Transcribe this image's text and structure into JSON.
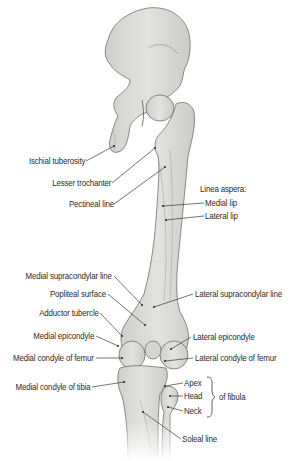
{
  "figure": {
    "colors": {
      "bone_fill": "#dcdcd9",
      "bone_shade": "#c9c9c5",
      "bone_outline": "#6f6f6b",
      "leader_line": "#3a3a3a",
      "label_text": "#2b2b2b",
      "background": "#ffffff"
    }
  },
  "labels": {
    "ischial_tuberosity": "Ischial tuberosity",
    "lesser_trochanter": "Lesser trochanter",
    "pectineal_line": "Pectineal line",
    "linea_aspera": "Linea aspera:",
    "medial_lip": "Medial lip",
    "lateral_lip": "Lateral lip",
    "medial_supracondylar_line": "Medial supracondylar line",
    "popliteal_surface": "Popliteal surface",
    "adductor_tubercle": "Adductor tubercle",
    "medial_epicondyle": "Medial epicondyle",
    "medial_condyle_femur": "Medial condyle of femur",
    "medial_condyle_tibia": "Medial condyle of tibia",
    "lateral_supracondylar_line": "Lateral supracondylar line",
    "lateral_epicondyle": "Lateral epicondyle",
    "lateral_condyle_femur": "Lateral condyle of femur",
    "apex": "Apex",
    "head": "Head",
    "neck": "Neck",
    "of_fibula": "of fibula",
    "soleal_line": "Soleal line"
  }
}
